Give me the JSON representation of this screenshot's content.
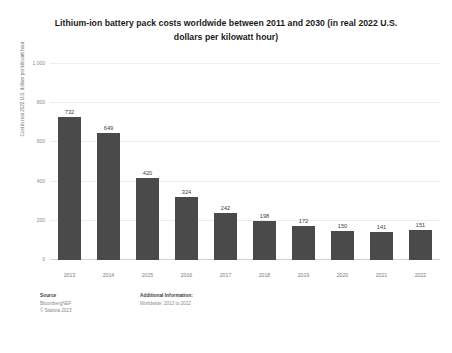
{
  "card": {
    "title": "Lithium-ion battery pack costs worldwide between 2011 and 2030 (in real 2022 U.S. dollars per kilowatt hour)"
  },
  "footer": {
    "source_heading": "Source",
    "source_name": "BloombergNEF",
    "copyright": "© Statista 2023",
    "additional_heading": "Additional Information:",
    "additional_text": "Worldwide; 2013 to 2022"
  },
  "caption": {
    "text": ""
  },
  "colors": {
    "bar": "#4a4a4a",
    "grid": "#ececec",
    "axis": "#d2d2d2",
    "tick_text": "#8a8a8a",
    "title_text": "#1a1a1a"
  },
  "chart_data": {
    "type": "bar",
    "title": "Lithium-ion battery pack costs worldwide between 2011 and 2030 (in real 2022 U.S. dollars per kilowatt hour)",
    "xlabel": "",
    "ylabel": "Cost in real 2022 U.S. dollars per kilowatt hour",
    "categories": [
      "2013",
      "2014",
      "2015",
      "2016",
      "2017",
      "2018",
      "2019",
      "2020",
      "2021",
      "2022"
    ],
    "values": [
      732,
      649,
      420,
      324,
      242,
      198,
      172,
      150,
      141,
      151
    ],
    "value_labels": [
      "732",
      "649",
      "420",
      "324",
      "242",
      "198",
      "172",
      "150",
      "141",
      "151"
    ],
    "ylim": [
      0,
      1000
    ],
    "yticks": [
      0,
      200,
      400,
      600,
      800,
      1000
    ],
    "ytick_labels": [
      "0",
      "200",
      "400",
      "600",
      "800",
      "1,000"
    ],
    "grid": true,
    "legend": false
  }
}
